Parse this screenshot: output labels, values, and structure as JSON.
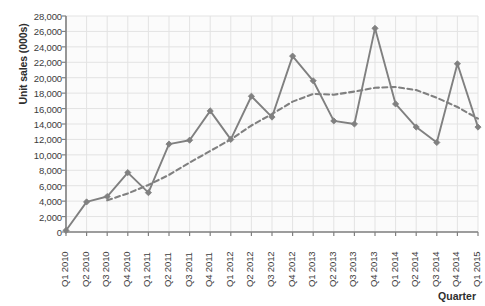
{
  "chart_data": {
    "type": "line",
    "title": "",
    "xlabel": "Quarter",
    "ylabel": "Unit sales (000s)",
    "ylim": [
      0,
      28000
    ],
    "ytick_step": 2000,
    "grid": true,
    "legend": "none",
    "categories": [
      "Q1 2010",
      "Q2 2010",
      "Q3 2010",
      "Q4 2010",
      "Q1 2011",
      "Q2 2011",
      "Q3 2011",
      "Q4 2011",
      "Q1 2012",
      "Q2 2012",
      "Q3 2012",
      "Q4 2012",
      "Q1 2013",
      "Q2 2013",
      "Q3 2013",
      "Q4 2013",
      "Q1 2014",
      "Q2 2014",
      "Q3 2014",
      "Q4 2014",
      "Q1 2015"
    ],
    "series": [
      {
        "name": "Unit sales",
        "style": "solid",
        "marker": "diamond",
        "color": "#808080",
        "values": [
          200,
          3900,
          4600,
          7700,
          5100,
          11400,
          11900,
          15700,
          12000,
          17600,
          14900,
          22800,
          19600,
          14400,
          14000,
          26400,
          16600,
          13600,
          11600,
          21800,
          13600
        ]
      },
      {
        "name": "Trend",
        "style": "dashed",
        "marker": "none",
        "color": "#808080",
        "values": [
          null,
          null,
          4100,
          5000,
          6100,
          7400,
          9000,
          10500,
          12000,
          13800,
          15300,
          16900,
          17900,
          17800,
          18200,
          18700,
          18800,
          18400,
          17400,
          16200,
          14700
        ]
      }
    ],
    "colors": {
      "line": "#808080",
      "grid": "#e3e3e3",
      "axis": "#808080",
      "plot_background": "#fbfbfb",
      "text": "#3c3c3c"
    }
  },
  "axes": {
    "y_ticks": [
      "0",
      "2,000",
      "4,000",
      "6,000",
      "8,000",
      "10,000",
      "12,000",
      "14,000",
      "16,000",
      "18,000",
      "20,000",
      "22,000",
      "24,000",
      "26,000",
      "28,000"
    ]
  }
}
